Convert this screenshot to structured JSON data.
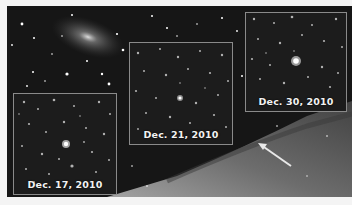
{
  "image": {
    "description": "Astronomical image of a galaxy with three inset star-field panels showing a transient source on three dates",
    "background_color": "#161616",
    "margin_color": "#f4f4f4"
  },
  "panels": [
    {
      "label": "Dec. 17, 2010",
      "x": 13,
      "y": 93,
      "w": 104,
      "h": 102
    },
    {
      "label": "Dec. 21, 2010",
      "x": 129,
      "y": 42,
      "w": 104,
      "h": 103
    },
    {
      "label": "Dec. 30, 2010",
      "x": 245,
      "y": 12,
      "w": 102,
      "h": 100
    }
  ],
  "annotations": {
    "arrow": {
      "icon": "arrow-pointer-icon",
      "from": [
        291,
        166
      ],
      "to": [
        258,
        143
      ],
      "color": "#e8e8e8"
    }
  }
}
